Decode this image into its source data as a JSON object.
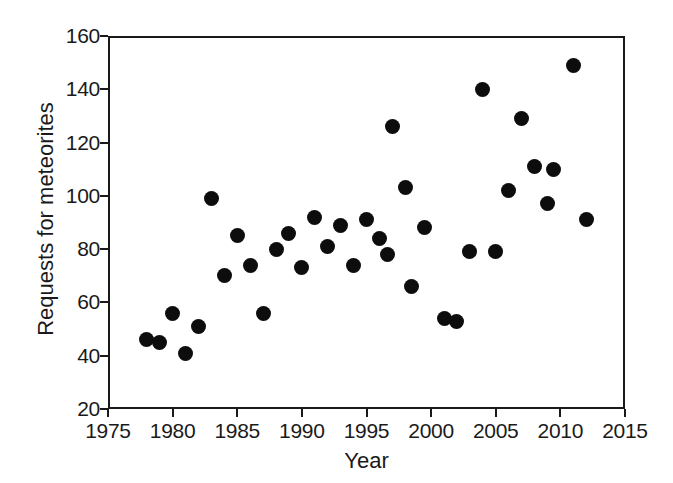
{
  "chart_data": {
    "type": "scatter",
    "title": "",
    "xlabel": "Year",
    "ylabel": "Requests for meteorites",
    "xlim": [
      1975,
      2015
    ],
    "ylim": [
      20,
      160
    ],
    "xticks": [
      1975,
      1980,
      1985,
      1990,
      1995,
      2000,
      2005,
      2010,
      2015
    ],
    "yticks": [
      20,
      40,
      60,
      80,
      100,
      120,
      140,
      160
    ],
    "grid": false,
    "legend": null,
    "marker": {
      "shape": "circle",
      "color": "#0d0d0d",
      "size_px": 15
    },
    "x": [
      1978,
      1979,
      1980,
      1981,
      1982,
      1983,
      1984,
      1985,
      1986,
      1987,
      1988,
      1989,
      1990,
      1991,
      1992,
      1993,
      1994,
      1995,
      1996,
      1997,
      1998,
      1999,
      2000,
      2001,
      2002,
      2003,
      2004,
      2005,
      2006,
      2007,
      2008,
      2009,
      2010,
      2011,
      2012
    ],
    "y": [
      46,
      45,
      56,
      41,
      51,
      99,
      70,
      85,
      74,
      56,
      80,
      86,
      73,
      92,
      81,
      89,
      74,
      91,
      84,
      78,
      126,
      103,
      66,
      88,
      54,
      53,
      79,
      140,
      79,
      102,
      129,
      111,
      97,
      110,
      149,
      91
    ],
    "points": [
      {
        "x": 1978,
        "y": 46
      },
      {
        "x": 1979,
        "y": 45
      },
      {
        "x": 1980,
        "y": 56
      },
      {
        "x": 1981,
        "y": 41
      },
      {
        "x": 1982,
        "y": 51
      },
      {
        "x": 1983,
        "y": 99
      },
      {
        "x": 1984,
        "y": 70
      },
      {
        "x": 1985,
        "y": 85
      },
      {
        "x": 1986,
        "y": 74
      },
      {
        "x": 1987,
        "y": 56
      },
      {
        "x": 1988,
        "y": 80
      },
      {
        "x": 1989,
        "y": 86
      },
      {
        "x": 1990,
        "y": 73
      },
      {
        "x": 1991,
        "y": 92
      },
      {
        "x": 1992,
        "y": 81
      },
      {
        "x": 1993,
        "y": 89
      },
      {
        "x": 1994,
        "y": 74
      },
      {
        "x": 1995,
        "y": 91
      },
      {
        "x": 1996,
        "y": 84
      },
      {
        "x": 1996.6,
        "y": 78
      },
      {
        "x": 1997,
        "y": 126
      },
      {
        "x": 1998,
        "y": 103
      },
      {
        "x": 1998.5,
        "y": 66
      },
      {
        "x": 1999.5,
        "y": 88
      },
      {
        "x": 2001,
        "y": 54
      },
      {
        "x": 2002,
        "y": 53
      },
      {
        "x": 2003,
        "y": 79
      },
      {
        "x": 2004,
        "y": 140
      },
      {
        "x": 2005,
        "y": 79
      },
      {
        "x": 2006,
        "y": 102
      },
      {
        "x": 2007,
        "y": 129
      },
      {
        "x": 2008,
        "y": 111
      },
      {
        "x": 2009,
        "y": 97
      },
      {
        "x": 2009.5,
        "y": 110
      },
      {
        "x": 2011,
        "y": 149
      },
      {
        "x": 2012,
        "y": 91
      }
    ]
  },
  "axes": {
    "x_title": "Year",
    "y_title": "Requests for meteorites",
    "x_tick_labels": [
      "1975",
      "1980",
      "1985",
      "1990",
      "1995",
      "2000",
      "2005",
      "2010",
      "2015"
    ],
    "y_tick_labels": [
      "20",
      "40",
      "60",
      "80",
      "100",
      "120",
      "140",
      "160"
    ]
  },
  "colors": {
    "marker": "#0d0d0d",
    "axis": "#1a1a1a",
    "background": "#ffffff"
  }
}
